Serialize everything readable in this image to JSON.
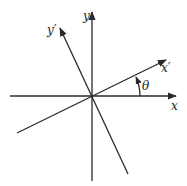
{
  "diagram": {
    "labels": {
      "x": "x",
      "y": "y",
      "x_prime": "x′",
      "y_prime": "y′",
      "theta": "θ"
    },
    "origin": [
      92,
      96
    ],
    "axes": {
      "x": {
        "from": [
          10,
          96
        ],
        "to": [
          176,
          96
        ],
        "arrow": true
      },
      "y": {
        "from": [
          92,
          181
        ],
        "to": [
          92,
          12
        ],
        "arrow": true
      },
      "x_prime": {
        "from": [
          17,
          133
        ],
        "to": [
          166,
          60
        ],
        "arrow": true
      },
      "y_prime": {
        "from": [
          128,
          174
        ],
        "to": [
          60,
          28
        ],
        "arrow": true
      }
    },
    "angle_arc": {
      "between": [
        "x",
        "x_prime"
      ],
      "label": "θ",
      "arrow": true
    },
    "colors": {
      "line": "#2a2a2a",
      "background": "#ffffff"
    }
  }
}
